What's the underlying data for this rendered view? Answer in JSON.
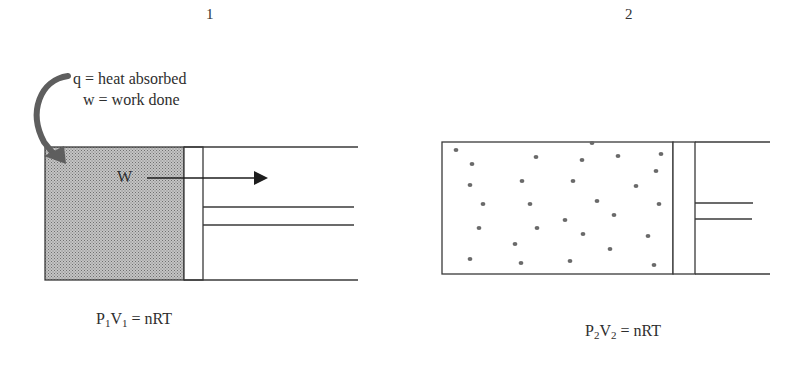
{
  "diagram": {
    "panels": [
      {
        "id": "1",
        "label": "1",
        "annotations": {
          "heat": "q = heat absorbed",
          "work": "w = work done",
          "work_arrow_label": "W"
        },
        "equation": {
          "P": "P",
          "P_sub": "1",
          "V": "V",
          "V_sub": "1",
          "rhs": " = nRT"
        },
        "state": "compressed gas (shaded)"
      },
      {
        "id": "2",
        "label": "2",
        "equation": {
          "P": "P",
          "P_sub": "2",
          "V": "V",
          "V_sub": "2",
          "rhs": " = nRT"
        },
        "state": "expanded gas (dispersed molecules)",
        "molecules": [
          [
            456,
            150
          ],
          [
            592,
            143
          ],
          [
            472,
            164
          ],
          [
            536,
            157
          ],
          [
            582,
            160
          ],
          [
            618,
            156
          ],
          [
            661,
            154
          ],
          [
            656,
            171
          ],
          [
            470,
            185
          ],
          [
            522,
            181
          ],
          [
            573,
            181
          ],
          [
            636,
            186
          ],
          [
            483,
            204
          ],
          [
            530,
            204
          ],
          [
            597,
            201
          ],
          [
            659,
            204
          ],
          [
            614,
            215
          ],
          [
            565,
            220
          ],
          [
            479,
            228
          ],
          [
            537,
            228
          ],
          [
            583,
            234
          ],
          [
            648,
            236
          ],
          [
            515,
            244
          ],
          [
            610,
            249
          ],
          [
            470,
            259
          ],
          [
            521,
            263
          ],
          [
            570,
            261
          ],
          [
            654,
            265
          ]
        ]
      }
    ],
    "colors": {
      "line": "#3a3a3a",
      "gas_fill": "#a9a9a9",
      "heat_arrow": "#5e5e5e",
      "molecule": "#6a6a6a"
    }
  }
}
